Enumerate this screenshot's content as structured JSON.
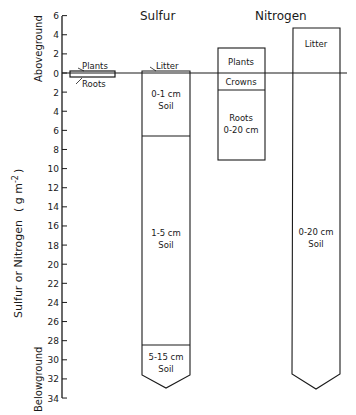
{
  "chart_data": {
    "type": "bar",
    "title": "",
    "ylabel": "Sulfur or Nitrogen ( g m-2 )",
    "ylabel_above": "Aboveground",
    "ylabel_below": "Belowground",
    "ylim": [
      -34,
      6
    ],
    "y_ticks": [
      "6",
      "4",
      "2",
      "0",
      "2",
      "4",
      "6",
      "8",
      "10",
      "12",
      "14",
      "16",
      "18",
      "20",
      "22",
      "24",
      "26",
      "28",
      "30",
      "32",
      "34"
    ],
    "y_tick_values": [
      6,
      4,
      2,
      0,
      -2,
      -4,
      -6,
      -8,
      -10,
      -12,
      -14,
      -16,
      -18,
      -20,
      -22,
      -24,
      -26,
      -28,
      -30,
      -32,
      -34
    ],
    "groups": [
      {
        "name": "Sulfur",
        "stacks": [
          {
            "name": "Sulfur plant stack",
            "segments": [
              {
                "label": "Plants",
                "from": 0,
                "to": 0.2
              },
              {
                "label": "Roots",
                "from": 0,
                "to": -0.4
              }
            ]
          },
          {
            "name": "Sulfur soil stack",
            "segments": [
              {
                "label": "Litter",
                "from": 0,
                "to": 0.2
              },
              {
                "label": "0-1 cm Soil",
                "from": 0,
                "to": -6.6
              },
              {
                "label": "1-5 cm Soil",
                "from": -6.6,
                "to": -28.5
              },
              {
                "label": "5-15 cm Soil",
                "from": -28.5,
                "to": -32.5
              }
            ]
          }
        ]
      },
      {
        "name": "Nitrogen",
        "stacks": [
          {
            "name": "Nitrogen plant stack",
            "segments": [
              {
                "label": "Plants",
                "from": 0,
                "to": 2.6
              },
              {
                "label": "Crowns",
                "from": 0,
                "to": -1.8
              },
              {
                "label": "Roots 0-20 cm",
                "from": -1.8,
                "to": -9.1
              }
            ]
          },
          {
            "name": "Nitrogen litter/soil stack",
            "segments": [
              {
                "label": "Litter",
                "from": 0,
                "to": 4.7
              },
              {
                "label": "0-20 cm Soil",
                "from": 0,
                "to": -32.5
              }
            ]
          }
        ]
      }
    ],
    "grid": false,
    "legend": "none"
  },
  "titles": {
    "sulfur": "Sulfur",
    "nitrogen": "Nitrogen"
  },
  "labels": {
    "s_plants": "Plants",
    "s_roots": "Roots",
    "s_litter": "Litter",
    "s_soil1_a": "0-1 cm",
    "s_soil1_b": "Soil",
    "s_soil2_a": "1-5 cm",
    "s_soil2_b": "Soil",
    "s_soil3_a": "5-15 cm",
    "s_soil3_b": "Soil",
    "n_plants": "Plants",
    "n_crowns": "Crowns",
    "n_roots_a": "Roots",
    "n_roots_b": "0-20 cm",
    "n_litter": "Litter",
    "n_soil_a": "0-20 cm",
    "n_soil_b": "Soil"
  },
  "axis": {
    "ylabel_main": "Sulfur or Nitrogen",
    "ylabel_units": "( g m",
    "ylabel_exp": "-2",
    "ylabel_close": ")",
    "above": "Aboveground",
    "below": "Belowground"
  }
}
